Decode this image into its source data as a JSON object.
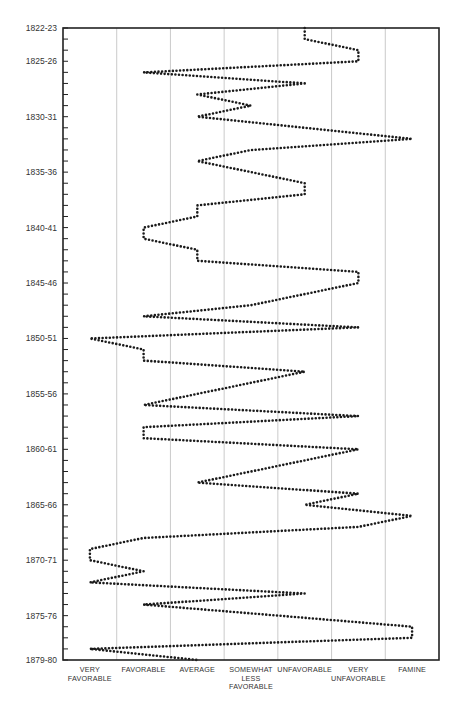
{
  "chart_data": {
    "type": "line",
    "title": "",
    "xlabel": "",
    "ylabel": "",
    "orientation": "vertical-time (years run top to bottom, category on x)",
    "x_categories": [
      "VERY FAVORABLE",
      "FAVORABLE",
      "AVERAGE",
      "SOMEWHAT LESS FAVORABLE",
      "UNFAVORABLE",
      "VERY UNFAVORABLE",
      "FAMINE"
    ],
    "x_category_labels_wrapped": [
      [
        "VERY",
        "FAVORABLE"
      ],
      [
        "FAVORABLE"
      ],
      [
        "AVERAGE"
      ],
      [
        "SOMEWHAT",
        "LESS",
        "FAVORABLE"
      ],
      [
        "UNFAVORABLE"
      ],
      [
        "VERY",
        "UNFAVORABLE"
      ],
      [
        "FAMINE"
      ]
    ],
    "value_scale": "1 = VERY FAVORABLE ... 7 = FAMINE",
    "y_tick_labels": [
      "1822-23",
      "1825-26",
      "1830-31",
      "1835-36",
      "1840-41",
      "1845-46",
      "1850-51",
      "1855-56",
      "1860-61",
      "1865-66",
      "1870-71",
      "1875-76",
      "1879-80"
    ],
    "grid": {
      "vertical": true,
      "horizontal": false
    },
    "legend": null,
    "series": [
      {
        "name": "Harvest conditions",
        "style": "dotted",
        "color": "#1a1a1a",
        "points": [
          {
            "year": "1822-23",
            "value": 5
          },
          {
            "year": "1823-24",
            "value": 5
          },
          {
            "year": "1824-25",
            "value": 6
          },
          {
            "year": "1825-26",
            "value": 6
          },
          {
            "year": "1826-27",
            "value": 2
          },
          {
            "year": "1827-28",
            "value": 5
          },
          {
            "year": "1828-29",
            "value": 3
          },
          {
            "year": "1829-30",
            "value": 4
          },
          {
            "year": "1830-31",
            "value": 3
          },
          {
            "year": "1831-32",
            "value": 5
          },
          {
            "year": "1832-33",
            "value": 7
          },
          {
            "year": "1833-34",
            "value": 4
          },
          {
            "year": "1834-35",
            "value": 3
          },
          {
            "year": "1835-36",
            "value": 4
          },
          {
            "year": "1836-37",
            "value": 5
          },
          {
            "year": "1837-38",
            "value": 5
          },
          {
            "year": "1838-39",
            "value": 3
          },
          {
            "year": "1839-40",
            "value": 3
          },
          {
            "year": "1840-41",
            "value": 2
          },
          {
            "year": "1841-42",
            "value": 2
          },
          {
            "year": "1842-43",
            "value": 3
          },
          {
            "year": "1843-44",
            "value": 3
          },
          {
            "year": "1844-45",
            "value": 6
          },
          {
            "year": "1845-46",
            "value": 6
          },
          {
            "year": "1846-47",
            "value": 5
          },
          {
            "year": "1847-48",
            "value": 4
          },
          {
            "year": "1848-49",
            "value": 2
          },
          {
            "year": "1849-50",
            "value": 6
          },
          {
            "year": "1850-51",
            "value": 1
          },
          {
            "year": "1851-52",
            "value": 2
          },
          {
            "year": "1852-53",
            "value": 2
          },
          {
            "year": "1853-54",
            "value": 5
          },
          {
            "year": "1854-55",
            "value": 4
          },
          {
            "year": "1855-56",
            "value": 3
          },
          {
            "year": "1856-57",
            "value": 2
          },
          {
            "year": "1857-58",
            "value": 6
          },
          {
            "year": "1858-59",
            "value": 2
          },
          {
            "year": "1859-60",
            "value": 2
          },
          {
            "year": "1860-61",
            "value": 6
          },
          {
            "year": "1861-62",
            "value": 5
          },
          {
            "year": "1862-63",
            "value": 4
          },
          {
            "year": "1863-64",
            "value": 3
          },
          {
            "year": "1864-65",
            "value": 6
          },
          {
            "year": "1865-66",
            "value": 5
          },
          {
            "year": "1866-67",
            "value": 7
          },
          {
            "year": "1867-68",
            "value": 6
          },
          {
            "year": "1868-69",
            "value": 2
          },
          {
            "year": "1869-70",
            "value": 1
          },
          {
            "year": "1870-71",
            "value": 1
          },
          {
            "year": "1871-72",
            "value": 2
          },
          {
            "year": "1872-73",
            "value": 1
          },
          {
            "year": "1873-74",
            "value": 5
          },
          {
            "year": "1874-75",
            "value": 2
          },
          {
            "year": "1875-76",
            "value": 4.5
          },
          {
            "year": "1876-77",
            "value": 7
          },
          {
            "year": "1877-78",
            "value": 7
          },
          {
            "year": "1878-79",
            "value": 1
          },
          {
            "year": "1879-80",
            "value": 3
          }
        ]
      }
    ]
  }
}
